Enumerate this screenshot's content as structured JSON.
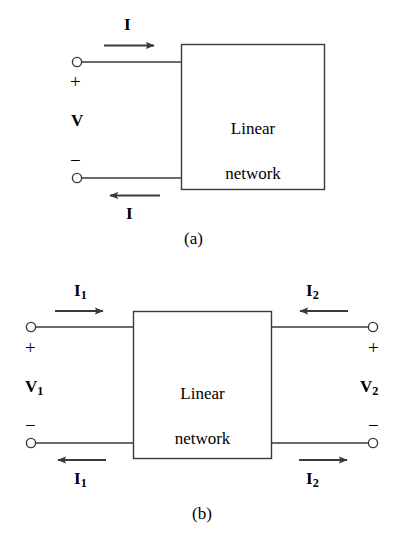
{
  "figure": {
    "stroke_color": "#3a3a3a",
    "text_color": "#000000",
    "background_color": "#ffffff",
    "box_label": "Linear\nnetwork"
  },
  "panel_a": {
    "caption": "(a)",
    "box_label_line1": "Linear",
    "box_label_line2": "network",
    "top_current": "I",
    "bottom_current": "I",
    "voltage": "V",
    "plus_sign": "+",
    "minus_sign": "−",
    "top_arrow_direction": "right",
    "bottom_arrow_direction": "left",
    "terminals": 2
  },
  "panel_b": {
    "caption": "(b)",
    "box_label_line1": "Linear",
    "box_label_line2": "network",
    "left_top_current": "I",
    "left_top_current_sub": "1",
    "left_bottom_current": "I",
    "left_bottom_current_sub": "1",
    "right_top_current": "I",
    "right_top_current_sub": "2",
    "right_bottom_current": "I",
    "right_bottom_current_sub": "2",
    "left_voltage": "V",
    "left_voltage_sub": "1",
    "right_voltage": "V",
    "right_voltage_sub": "2",
    "left_plus_sign": "+",
    "left_minus_sign": "−",
    "right_plus_sign": "+",
    "right_minus_sign": "−",
    "left_top_arrow_direction": "right",
    "left_bottom_arrow_direction": "left",
    "right_top_arrow_direction": "left",
    "right_bottom_arrow_direction": "right",
    "terminals": 4
  }
}
